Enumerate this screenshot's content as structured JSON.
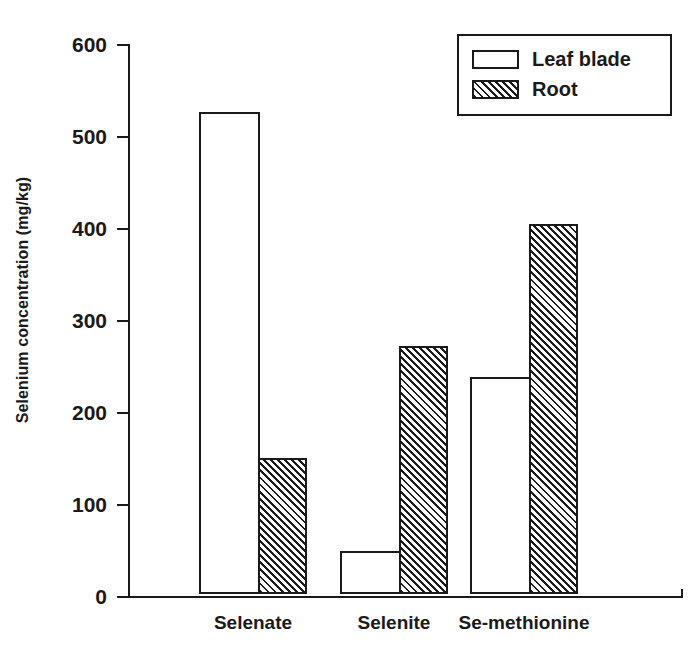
{
  "chart_data": {
    "type": "bar",
    "title": "",
    "xlabel": "",
    "ylabel": "Selenium concentration (mg/kg)",
    "categories": [
      "Selenate",
      "Selenite",
      "Se-methionine"
    ],
    "series": [
      {
        "name": "Leaf blade",
        "values": [
          524,
          47,
          236
        ],
        "fill": "white",
        "pattern": "none"
      },
      {
        "name": "Root",
        "values": [
          148,
          270,
          402
        ],
        "fill": "white",
        "pattern": "diagonal-hatch"
      }
    ],
    "ylim": [
      0,
      600
    ],
    "yticks": [
      0,
      100,
      200,
      300,
      400,
      500,
      600
    ],
    "ytick_labels": [
      "0",
      "100",
      "200",
      "300",
      "400",
      "500",
      "600"
    ],
    "grid": false,
    "legend_position": "top-right",
    "legend_entries": [
      "Leaf blade",
      "Root"
    ],
    "colors": {
      "ink": "#1a1a1a",
      "background": "#ffffff"
    }
  }
}
